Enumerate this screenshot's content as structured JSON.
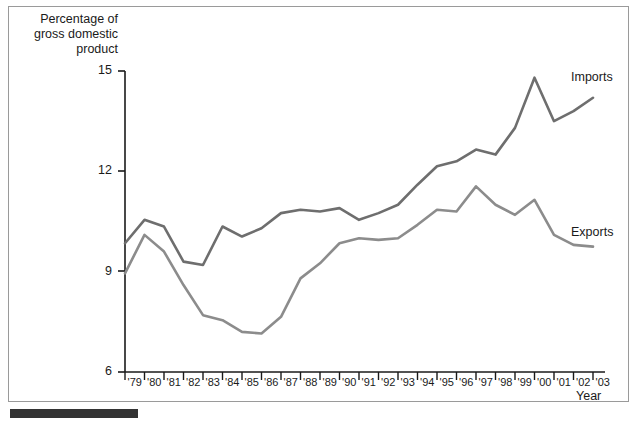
{
  "figure": {
    "background_color": "#ffffff",
    "frame_color": "#9a9a9a",
    "line_color": "#7a7a7a",
    "axis_color": "#1a1a1a"
  },
  "axes": {
    "ylabel": "Percentage of\ngross domestic\nproduct",
    "xlabel": "Year",
    "yticks": [
      "15",
      "12",
      "9",
      "6"
    ],
    "xticks": [
      "'79",
      "'80",
      "'81",
      "'82",
      "'83",
      "'84",
      "'85",
      "'86",
      "'87",
      "'88",
      "'89",
      "'90",
      "'91",
      "'92",
      "'93",
      "'94",
      "'95",
      "'96",
      "'97",
      "'98",
      "'99",
      "'00",
      "'01",
      "'02",
      "'03"
    ]
  },
  "labels": {
    "imports": "Imports",
    "exports": "Exports"
  },
  "chart_data": {
    "type": "line",
    "title": "",
    "xlabel": "Year",
    "ylabel": "Percentage of gross domestic product",
    "xlim": [
      1979,
      2003
    ],
    "ylim": [
      6,
      15.6
    ],
    "yticks": [
      6,
      9,
      12,
      15
    ],
    "grid": false,
    "legend_position": "right-inline",
    "x": [
      1979,
      1980,
      1981,
      1982,
      1983,
      1984,
      1985,
      1986,
      1987,
      1988,
      1989,
      1990,
      1991,
      1992,
      1993,
      1994,
      1995,
      1996,
      1997,
      1998,
      1999,
      2000,
      2001,
      2002,
      2003
    ],
    "xtick_labels": [
      "'79",
      "'80",
      "'81",
      "'82",
      "'83",
      "'84",
      "'85",
      "'86",
      "'87",
      "'88",
      "'89",
      "'90",
      "'91",
      "'92",
      "'93",
      "'94",
      "'95",
      "'96",
      "'97",
      "'98",
      "'99",
      "'00",
      "'01",
      "'02",
      "'03"
    ],
    "series": [
      {
        "name": "Imports",
        "color": "#6e6e6e",
        "values": [
          9.85,
          10.55,
          10.35,
          9.3,
          9.2,
          10.35,
          10.05,
          10.3,
          10.75,
          10.85,
          10.8,
          10.9,
          10.55,
          10.75,
          11.0,
          11.6,
          12.15,
          12.3,
          12.65,
          12.5,
          13.3,
          14.8,
          13.5,
          13.8,
          14.2
        ]
      },
      {
        "name": "Exports",
        "color": "#8c8c8c",
        "values": [
          8.95,
          10.1,
          9.6,
          8.6,
          7.7,
          7.55,
          7.2,
          7.15,
          7.65,
          8.8,
          9.25,
          9.85,
          10.0,
          9.95,
          10.0,
          10.4,
          10.85,
          10.8,
          11.55,
          11.0,
          10.7,
          11.15,
          10.1,
          9.8,
          9.75
        ]
      }
    ]
  }
}
